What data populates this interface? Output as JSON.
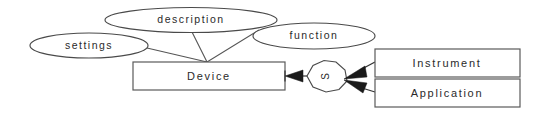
{
  "diagram": {
    "type": "entity-relationship-diagram",
    "background_color": "#ffffff",
    "line_color": "#4a4a4a",
    "text_color": "#2a2a2a",
    "arrow_color": "#1a1a1a",
    "attributes": [
      {
        "id": "settings",
        "label": "settings",
        "shape": "ellipse"
      },
      {
        "id": "description",
        "label": "description",
        "shape": "ellipse"
      },
      {
        "id": "function",
        "label": "function",
        "shape": "ellipse"
      }
    ],
    "entities": [
      {
        "id": "device",
        "label": "Device",
        "shape": "rectangle"
      },
      {
        "id": "instrument",
        "label": "Instrument",
        "shape": "rectangle"
      },
      {
        "id": "application",
        "label": "Application",
        "shape": "rectangle"
      }
    ],
    "relationships": [
      {
        "id": "s-relationship",
        "label": "S",
        "shape": "octagon",
        "label_rotation": -90
      }
    ],
    "edges": [
      {
        "from": "settings",
        "to": "device",
        "style": "plain"
      },
      {
        "from": "description",
        "to": "device",
        "style": "plain"
      },
      {
        "from": "function",
        "to": "device",
        "style": "plain"
      },
      {
        "from": "s-relationship",
        "to": "device",
        "style": "filled-arrow"
      },
      {
        "from": "instrument",
        "to": "s-relationship",
        "style": "filled-arrow"
      },
      {
        "from": "application",
        "to": "s-relationship",
        "style": "filled-arrow"
      }
    ]
  }
}
